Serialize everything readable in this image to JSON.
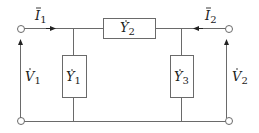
{
  "diagram": {
    "type": "two-port pi network",
    "colors": {
      "line": "#6a6a6a",
      "text": "#222222",
      "background": "#ffffff"
    },
    "currents": [
      {
        "id": "I1",
        "symbol": "I",
        "subscript": "1",
        "dot": true,
        "direction": "right"
      },
      {
        "id": "I2",
        "symbol": "I",
        "subscript": "2",
        "dot": true,
        "direction": "left"
      }
    ],
    "voltages": [
      {
        "id": "V1",
        "symbol": "V",
        "subscript": "1",
        "dot": true,
        "direction": "up"
      },
      {
        "id": "V2",
        "symbol": "V",
        "subscript": "2",
        "dot": true,
        "direction": "up"
      }
    ],
    "admittances": [
      {
        "id": "Y1",
        "symbol": "Y",
        "subscript": "1",
        "dot": true,
        "position": "left shunt"
      },
      {
        "id": "Y2",
        "symbol": "Y",
        "subscript": "2",
        "dot": true,
        "position": "series top"
      },
      {
        "id": "Y3",
        "symbol": "Y",
        "subscript": "3",
        "dot": true,
        "position": "right shunt"
      }
    ],
    "terminals": [
      "port1-top",
      "port1-bottom",
      "port2-top",
      "port2-bottom"
    ]
  }
}
